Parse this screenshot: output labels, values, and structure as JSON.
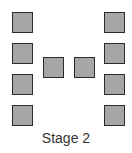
{
  "diagram": {
    "caption": "Stage 2",
    "square_fill": "#a6a6a6",
    "square_border": "#2b2b2b",
    "groups": [
      {
        "name": "left-column",
        "count": 4
      },
      {
        "name": "middle-row",
        "count": 2
      },
      {
        "name": "right-column",
        "count": 4
      }
    ]
  }
}
